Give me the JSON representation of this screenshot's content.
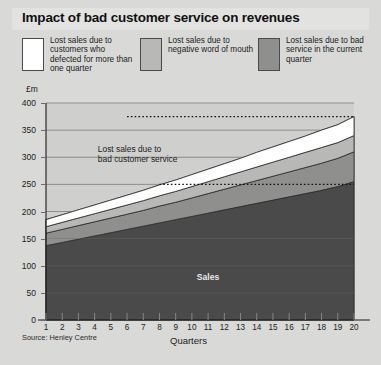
{
  "title": "Impact of bad customer service on revenues",
  "legend": [
    {
      "label": "Lost sales due to customers who defected for more than one quarter",
      "color": "#ffffff"
    },
    {
      "label": "Lost sales due to negative word of mouth",
      "color": "#b8b8b6"
    },
    {
      "label": "Lost sales due to bad service in the current quarter",
      "color": "#8f8f8d"
    }
  ],
  "annotation": "Lost sales due to\nbad customer service",
  "sales_label": "Sales",
  "source": "Source: Henley Centre",
  "colors": {
    "background": "#d9d9d7",
    "plot_background": "#cfcfcd",
    "sales": "#4a4a4a",
    "grid": "#7a7a78",
    "axis": "#1c1c1c"
  },
  "chart_data": {
    "type": "area",
    "title": "Impact of bad customer service on revenues",
    "xlabel": "Quarters",
    "ylabel": "£m",
    "ylim": [
      0,
      400
    ],
    "ytick_values": [
      0,
      50,
      100,
      150,
      200,
      250,
      300,
      350,
      400
    ],
    "ytick_labels": [
      "0",
      "50",
      "100",
      "150",
      "200",
      "250",
      "300",
      "350",
      "400"
    ],
    "xlim": [
      1,
      20
    ],
    "x": [
      1,
      2,
      3,
      4,
      5,
      6,
      7,
      8,
      9,
      10,
      11,
      12,
      13,
      14,
      15,
      16,
      17,
      18,
      19,
      20
    ],
    "categories": [
      "1",
      "2",
      "3",
      "4",
      "5",
      "6",
      "7",
      "8",
      "9",
      "10",
      "11",
      "12",
      "13",
      "14",
      "15",
      "16",
      "17",
      "18",
      "19",
      "20"
    ],
    "xtick_labels": [
      "1",
      "2",
      "3",
      "4",
      "5",
      "6",
      "7",
      "8",
      "9",
      "10",
      "11",
      "12",
      "13",
      "14",
      "15",
      "16",
      "17",
      "18",
      "19",
      "20"
    ],
    "stacked": true,
    "grid": true,
    "legend_position": "top",
    "series": [
      {
        "name": "Sales",
        "color": "#4a4a4a",
        "values": [
          137,
          143,
          149,
          155,
          161,
          167,
          173,
          179,
          185,
          191,
          197,
          203,
          209,
          215,
          221,
          227,
          233,
          239,
          246,
          255
        ]
      },
      {
        "name": "Lost sales due to bad service in the current quarter",
        "color": "#8f8f8d",
        "values": [
          23,
          24,
          25,
          26,
          27,
          28,
          29,
          31,
          32,
          34,
          36,
          38,
          40,
          42,
          44,
          46,
          48,
          50,
          52,
          55
        ]
      },
      {
        "name": "Lost sales due to negative word of mouth",
        "color": "#b8b8b6",
        "values": [
          12,
          13,
          14,
          15,
          16,
          17,
          18,
          19,
          20,
          21,
          22,
          23,
          24,
          25,
          26,
          27,
          28,
          29,
          29,
          30
        ]
      },
      {
        "name": "Lost sales due to customers who defected for more than one quarter",
        "color": "#ffffff",
        "values": [
          13,
          14,
          15,
          16,
          17,
          18,
          19,
          20,
          21,
          22,
          23,
          24,
          25,
          27,
          28,
          29,
          30,
          32,
          33,
          35
        ]
      }
    ],
    "totals": [
      185,
      194,
      203,
      212,
      221,
      230,
      239,
      249,
      258,
      268,
      278,
      288,
      298,
      309,
      319,
      329,
      339,
      350,
      360,
      375
    ],
    "reference_lines": [
      {
        "value": 375,
        "style": "dotted",
        "x_from": 6,
        "x_to": 20
      },
      {
        "value": 250,
        "style": "dotted",
        "x_from": 8,
        "x_to": 20
      }
    ]
  }
}
